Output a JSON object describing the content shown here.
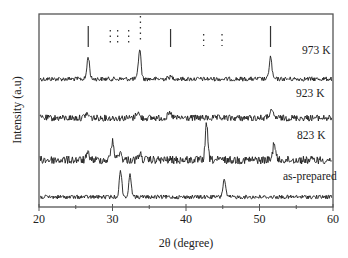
{
  "chart_data": {
    "type": "line",
    "title": "",
    "xlabel": "2θ (degree)",
    "ylabel": "Intensity (a.u)",
    "xlim": [
      20,
      60
    ],
    "x_ticks": [
      20,
      30,
      40,
      50,
      60
    ],
    "x_tick_labels": [
      "20",
      "30",
      "40",
      "50",
      "60"
    ],
    "y_ticks": [],
    "grid": false,
    "legend": "inline labels at right end of each trace",
    "series": [
      {
        "name": "973 K",
        "baseline_px": 79,
        "noise": 2.2,
        "peaks": [
          {
            "x": 26.7,
            "height": 22,
            "width": 0.25
          },
          {
            "x": 33.7,
            "height": 30,
            "width": 0.25
          },
          {
            "x": 37.9,
            "height": 2,
            "width": 0.5
          },
          {
            "x": 51.5,
            "height": 22,
            "width": 0.25
          }
        ]
      },
      {
        "name": "923 K",
        "baseline_px": 118,
        "noise": 3.2,
        "peaks": [
          {
            "x": 26.5,
            "height": 4,
            "width": 0.4
          },
          {
            "x": 33.4,
            "height": 6,
            "width": 0.3
          },
          {
            "x": 37.8,
            "height": 4,
            "width": 0.4
          },
          {
            "x": 51.6,
            "height": 6,
            "width": 0.4
          }
        ]
      },
      {
        "name": "823 K",
        "baseline_px": 160,
        "noise": 4.0,
        "peaks": [
          {
            "x": 26.7,
            "height": 6,
            "width": 0.3
          },
          {
            "x": 30.0,
            "height": 18,
            "width": 0.3
          },
          {
            "x": 31.0,
            "height": 8,
            "width": 0.3
          },
          {
            "x": 33.7,
            "height": 6,
            "width": 0.3
          },
          {
            "x": 42.8,
            "height": 35,
            "width": 0.25
          },
          {
            "x": 52.0,
            "height": 18,
            "width": 0.25
          }
        ]
      },
      {
        "name": "as-prepared",
        "baseline_px": 197,
        "noise": 2.0,
        "peaks": [
          {
            "x": 31.1,
            "height": 26,
            "width": 0.25
          },
          {
            "x": 32.4,
            "height": 22,
            "width": 0.25
          },
          {
            "x": 45.2,
            "height": 18,
            "width": 0.25
          }
        ]
      }
    ],
    "reference_markers": [
      {
        "x": 26.7,
        "style": "solid",
        "top_px": 26,
        "bottom_px": 47
      },
      {
        "x": 29.7,
        "style": "dotted",
        "top_px": 30,
        "bottom_px": 43
      },
      {
        "x": 30.7,
        "style": "dotted",
        "top_px": 30,
        "bottom_px": 43
      },
      {
        "x": 32.2,
        "style": "dotted",
        "top_px": 30,
        "bottom_px": 43
      },
      {
        "x": 33.8,
        "style": "dotted",
        "top_px": 16,
        "bottom_px": 43
      },
      {
        "x": 37.9,
        "style": "solid",
        "top_px": 29,
        "bottom_px": 47
      },
      {
        "x": 42.4,
        "style": "dotted",
        "top_px": 34,
        "bottom_px": 46
      },
      {
        "x": 44.9,
        "style": "dotted",
        "top_px": 34,
        "bottom_px": 46
      },
      {
        "x": 51.5,
        "style": "solid",
        "top_px": 26,
        "bottom_px": 47
      }
    ],
    "series_labels": [
      {
        "text": "973 K",
        "x_px": 302,
        "y_px": 52
      },
      {
        "text": "923 K",
        "x_px": 296,
        "y_px": 95
      },
      {
        "text": "823 K",
        "x_px": 297,
        "y_px": 137
      },
      {
        "text": "as-prepared",
        "x_px": 282,
        "y_px": 178
      }
    ]
  },
  "axes": {
    "x_title": "2θ (degree)",
    "y_title": "Intensity (a.u)",
    "x_ticks": [
      "20",
      "30",
      "40",
      "50",
      "60"
    ]
  },
  "labels": {
    "s973": "973 K",
    "s923": "923 K",
    "s823": "823 K",
    "sprep": "as-prepared"
  },
  "colors": {
    "trace": "#1e1e1e",
    "frame": "#444444",
    "text": "#222222",
    "background": "#ffffff"
  }
}
